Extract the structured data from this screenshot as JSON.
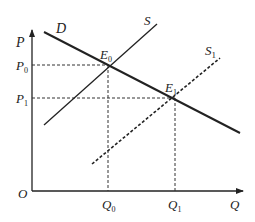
{
  "diagram": {
    "type": "supply-demand",
    "axes": {
      "y_label": "P",
      "x_label": "Q",
      "origin_label": "O"
    },
    "curves": {
      "demand": {
        "label": "D",
        "style": "solid"
      },
      "supply": {
        "label": "S",
        "style": "solid"
      },
      "supply_shifted": {
        "label": "S",
        "subscript": "1",
        "style": "dashed"
      }
    },
    "points": {
      "e0": {
        "label": "E",
        "subscript": "0"
      },
      "e1": {
        "label": "E",
        "subscript": "1"
      }
    },
    "ticks": {
      "p0": {
        "label": "P",
        "subscript": "0"
      },
      "p1": {
        "label": "P",
        "subscript": "1"
      },
      "q0": {
        "label": "Q",
        "subscript": "0"
      },
      "q1": {
        "label": "Q",
        "subscript": "1"
      }
    },
    "colors": {
      "line": "#222222",
      "background": "#ffffff"
    }
  }
}
